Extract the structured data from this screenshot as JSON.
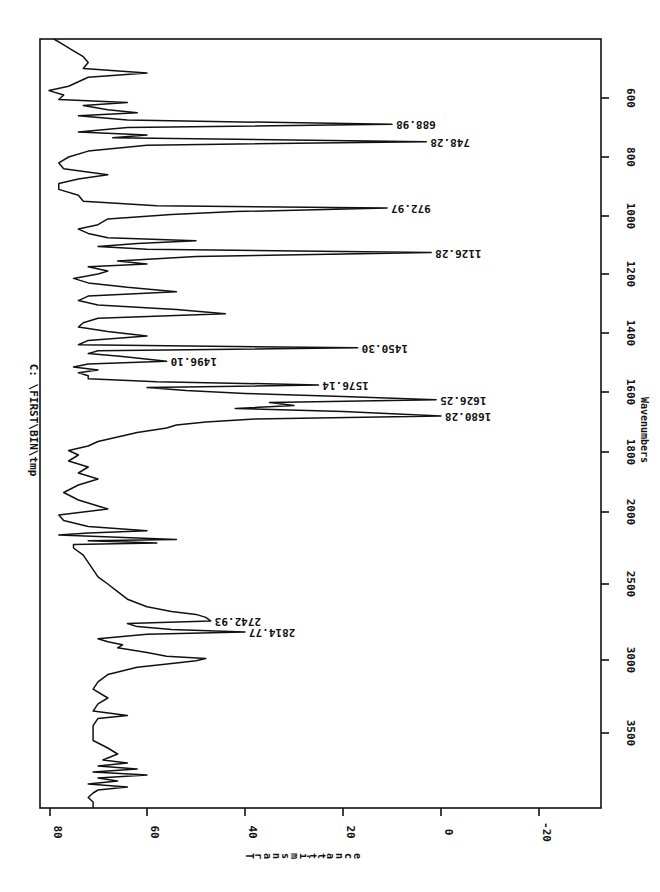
{
  "chart_data": {
    "type": "line",
    "title": "C: \\FIRST\\BIN\\tmp",
    "xlabel": "Wavenumbers",
    "ylabel": "Transmittance",
    "orientation": "rotated 90° clockwise (wavenumber axis vertical on right, transmittance axis horizontal at bottom)",
    "xlim": [
      4000,
      400
    ],
    "ylim": [
      -25,
      82
    ],
    "x_ticks": [
      3500,
      3000,
      2500,
      2000,
      1800,
      1600,
      1400,
      1200,
      1000,
      800,
      600
    ],
    "y_ticks": [
      80,
      60,
      40,
      20,
      0,
      -20
    ],
    "grid": false,
    "legend": null,
    "peaks": [
      {
        "label": "688.98",
        "x": 689,
        "y": 10
      },
      {
        "label": "748.28",
        "x": 748,
        "y": 3
      },
      {
        "label": "972.97",
        "x": 973,
        "y": 11
      },
      {
        "label": "1126.28",
        "x": 1126,
        "y": 2
      },
      {
        "label": "1450.30",
        "x": 1450,
        "y": 17
      },
      {
        "label": "1496.10",
        "x": 1496,
        "y": 56
      },
      {
        "label": "1576.14",
        "x": 1576,
        "y": 25
      },
      {
        "label": "1626.25",
        "x": 1626,
        "y": 1
      },
      {
        "label": "1680.28",
        "x": 1680,
        "y": 0
      },
      {
        "label": "2742.93",
        "x": 2743,
        "y": 47
      },
      {
        "label": "2814.77",
        "x": 2815,
        "y": 40
      }
    ],
    "series": [
      {
        "name": "spectrum",
        "points": [
          [
            400,
            79
          ],
          [
            420,
            77
          ],
          [
            440,
            75
          ],
          [
            460,
            73
          ],
          [
            480,
            72
          ],
          [
            500,
            73
          ],
          [
            515,
            60
          ],
          [
            530,
            72
          ],
          [
            545,
            74
          ],
          [
            560,
            76
          ],
          [
            575,
            80
          ],
          [
            590,
            77
          ],
          [
            605,
            78
          ],
          [
            615,
            64
          ],
          [
            625,
            73
          ],
          [
            640,
            68
          ],
          [
            650,
            62
          ],
          [
            660,
            74
          ],
          [
            675,
            64
          ],
          [
            689,
            10
          ],
          [
            700,
            64
          ],
          [
            715,
            74
          ],
          [
            725,
            60
          ],
          [
            735,
            67
          ],
          [
            748,
            3
          ],
          [
            760,
            60
          ],
          [
            780,
            72
          ],
          [
            800,
            76
          ],
          [
            820,
            78
          ],
          [
            840,
            77
          ],
          [
            860,
            68
          ],
          [
            875,
            74
          ],
          [
            890,
            78
          ],
          [
            910,
            78
          ],
          [
            930,
            74
          ],
          [
            950,
            73
          ],
          [
            965,
            58
          ],
          [
            973,
            11
          ],
          [
            985,
            42
          ],
          [
            995,
            55
          ],
          [
            1010,
            68
          ],
          [
            1030,
            70
          ],
          [
            1045,
            74
          ],
          [
            1060,
            72
          ],
          [
            1075,
            68
          ],
          [
            1085,
            50
          ],
          [
            1095,
            62
          ],
          [
            1105,
            70
          ],
          [
            1115,
            60
          ],
          [
            1126,
            2
          ],
          [
            1140,
            50
          ],
          [
            1155,
            66
          ],
          [
            1165,
            60
          ],
          [
            1175,
            72
          ],
          [
            1190,
            68
          ],
          [
            1200,
            70
          ],
          [
            1215,
            75
          ],
          [
            1230,
            72
          ],
          [
            1245,
            64
          ],
          [
            1260,
            54
          ],
          [
            1275,
            72
          ],
          [
            1290,
            74
          ],
          [
            1305,
            70
          ],
          [
            1320,
            54
          ],
          [
            1335,
            44
          ],
          [
            1350,
            70
          ],
          [
            1365,
            73
          ],
          [
            1380,
            74
          ],
          [
            1395,
            68
          ],
          [
            1410,
            60
          ],
          [
            1425,
            72
          ],
          [
            1440,
            74
          ],
          [
            1450,
            17
          ],
          [
            1460,
            70
          ],
          [
            1470,
            72
          ],
          [
            1480,
            65
          ],
          [
            1496,
            56
          ],
          [
            1505,
            72
          ],
          [
            1515,
            75
          ],
          [
            1525,
            70
          ],
          [
            1535,
            74
          ],
          [
            1545,
            72
          ],
          [
            1555,
            72
          ],
          [
            1565,
            58
          ],
          [
            1576,
            25
          ],
          [
            1585,
            60
          ],
          [
            1595,
            52
          ],
          [
            1605,
            40
          ],
          [
            1615,
            20
          ],
          [
            1626,
            1
          ],
          [
            1635,
            35
          ],
          [
            1645,
            30
          ],
          [
            1655,
            42
          ],
          [
            1665,
            20
          ],
          [
            1680,
            0
          ],
          [
            1690,
            38
          ],
          [
            1700,
            48
          ],
          [
            1710,
            54
          ],
          [
            1720,
            56
          ],
          [
            1735,
            62
          ],
          [
            1750,
            66
          ],
          [
            1765,
            70
          ],
          [
            1780,
            72
          ],
          [
            1795,
            76
          ],
          [
            1810,
            74
          ],
          [
            1830,
            76
          ],
          [
            1850,
            72
          ],
          [
            1870,
            74
          ],
          [
            1890,
            70
          ],
          [
            1910,
            74
          ],
          [
            1935,
            77
          ],
          [
            1960,
            74
          ],
          [
            1990,
            68
          ],
          [
            2020,
            78
          ],
          [
            2060,
            77
          ],
          [
            2100,
            72
          ],
          [
            2130,
            60
          ],
          [
            2145,
            72
          ],
          [
            2160,
            78
          ],
          [
            2180,
            62
          ],
          [
            2190,
            54
          ],
          [
            2200,
            72
          ],
          [
            2215,
            58
          ],
          [
            2225,
            75
          ],
          [
            2250,
            75
          ],
          [
            2300,
            73
          ],
          [
            2350,
            72
          ],
          [
            2400,
            71
          ],
          [
            2450,
            70
          ],
          [
            2500,
            68
          ],
          [
            2550,
            66
          ],
          [
            2600,
            64
          ],
          [
            2650,
            60
          ],
          [
            2680,
            55
          ],
          [
            2700,
            50
          ],
          [
            2720,
            48
          ],
          [
            2743,
            47
          ],
          [
            2760,
            64
          ],
          [
            2780,
            62
          ],
          [
            2800,
            55
          ],
          [
            2815,
            40
          ],
          [
            2830,
            60
          ],
          [
            2860,
            70
          ],
          [
            2880,
            68
          ],
          [
            2900,
            65
          ],
          [
            2920,
            66
          ],
          [
            2950,
            60
          ],
          [
            2975,
            56
          ],
          [
            2990,
            48
          ],
          [
            3005,
            50
          ],
          [
            3020,
            54
          ],
          [
            3050,
            62
          ],
          [
            3100,
            68
          ],
          [
            3150,
            70
          ],
          [
            3200,
            71
          ],
          [
            3260,
            68
          ],
          [
            3300,
            70
          ],
          [
            3350,
            71
          ],
          [
            3380,
            64
          ],
          [
            3400,
            70
          ],
          [
            3450,
            71
          ],
          [
            3500,
            71
          ],
          [
            3550,
            71
          ],
          [
            3600,
            68
          ],
          [
            3640,
            66
          ],
          [
            3680,
            69
          ],
          [
            3700,
            64
          ],
          [
            3720,
            70
          ],
          [
            3740,
            62
          ],
          [
            3760,
            71
          ],
          [
            3780,
            60
          ],
          [
            3800,
            70
          ],
          [
            3820,
            66
          ],
          [
            3840,
            72
          ],
          [
            3860,
            64
          ],
          [
            3880,
            70
          ],
          [
            3900,
            71
          ],
          [
            3930,
            72
          ],
          [
            3960,
            71
          ],
          [
            4000,
            71
          ]
        ]
      }
    ]
  },
  "chart": {
    "title": "C: \\FIRST\\BIN\\tmp",
    "xlabel": "Wavenumbers",
    "ylabel": "Transmittance",
    "x_tick_labels": [
      "3500",
      "3000",
      "2500",
      "2000",
      "1800",
      "1600",
      "1400",
      "1200",
      "1000",
      "800",
      "600"
    ],
    "y_tick_labels": [
      "80",
      "60",
      "40",
      "20",
      "0",
      "-20"
    ]
  }
}
